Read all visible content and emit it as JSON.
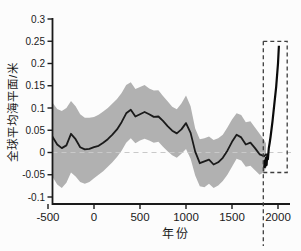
{
  "colors": {
    "background": "#fcfcfc",
    "band": "#b1b1b1",
    "median": "#1a1a1a",
    "instrumental": "#0a0a0a",
    "axis": "#1a1a1a",
    "text": "#1a1a1a",
    "zero_line": "#c9c9c9",
    "highlight_box": "#3d3d3d"
  },
  "chart_data": {
    "type": "line",
    "title": "",
    "xlabel": "年份",
    "ylabel": "全球平均海平面/米",
    "xlim": [
      -500,
      2130
    ],
    "ylim": [
      -0.118,
      0.3
    ],
    "x_ticks": [
      -500,
      0,
      500,
      1000,
      1500,
      2000
    ],
    "y_tick_labels": [
      "0.3",
      "0.25",
      "0.2",
      "0.15",
      "0.1",
      "0.05",
      "0",
      "-0.05",
      "-0.1"
    ],
    "grid": false,
    "legend": "none",
    "zero_reference_line": {
      "value": 0,
      "style": "dashed"
    },
    "highlight_box": {
      "x0": 1840,
      "x1": 2100,
      "y0": -0.045,
      "y1": 0.25,
      "style": "dashed",
      "note": "box around instrumental period; left edge extends below x-axis"
    },
    "series": [
      {
        "name": "reconstruction_uncertainty",
        "type": "band",
        "x": [
          -500,
          -450,
          -400,
          -350,
          -300,
          -250,
          -200,
          -150,
          -100,
          -50,
          0,
          50,
          100,
          150,
          200,
          250,
          300,
          350,
          400,
          450,
          500,
          550,
          600,
          650,
          700,
          750,
          800,
          850,
          900,
          950,
          1000,
          1050,
          1100,
          1150,
          1200,
          1250,
          1300,
          1350,
          1400,
          1450,
          1500,
          1550,
          1600,
          1650,
          1700,
          1750,
          1800,
          1850,
          1870
        ],
        "upper": [
          0.13,
          0.112,
          0.098,
          0.093,
          0.1,
          0.116,
          0.104,
          0.086,
          0.078,
          0.078,
          0.08,
          0.085,
          0.092,
          0.1,
          0.11,
          0.12,
          0.134,
          0.152,
          0.158,
          0.143,
          0.147,
          0.152,
          0.144,
          0.139,
          0.14,
          0.127,
          0.115,
          0.103,
          0.097,
          0.11,
          0.128,
          0.104,
          0.054,
          0.03,
          0.032,
          0.036,
          0.028,
          0.032,
          0.04,
          0.056,
          0.074,
          0.088,
          0.084,
          0.068,
          0.07,
          0.056,
          0.042,
          0.028,
          0.02
        ],
        "lower": [
          -0.035,
          -0.055,
          -0.072,
          -0.08,
          -0.068,
          -0.045,
          -0.054,
          -0.066,
          -0.07,
          -0.066,
          -0.058,
          -0.05,
          -0.042,
          -0.032,
          -0.022,
          -0.01,
          0.004,
          0.022,
          0.032,
          0.021,
          0.027,
          0.031,
          0.027,
          0.022,
          0.024,
          0.013,
          0.003,
          -0.006,
          -0.012,
          -0.003,
          0.008,
          -0.014,
          -0.052,
          -0.076,
          -0.078,
          -0.07,
          -0.08,
          -0.074,
          -0.064,
          -0.05,
          -0.032,
          -0.014,
          -0.018,
          -0.032,
          -0.03,
          -0.04,
          -0.05,
          -0.044,
          -0.034
        ]
      },
      {
        "name": "reconstruction_median",
        "type": "line",
        "x": [
          -500,
          -450,
          -400,
          -350,
          -300,
          -250,
          -200,
          -150,
          -100,
          -50,
          0,
          50,
          100,
          150,
          200,
          250,
          300,
          350,
          400,
          450,
          500,
          550,
          600,
          650,
          700,
          750,
          800,
          850,
          900,
          950,
          1000,
          1050,
          1100,
          1150,
          1200,
          1250,
          1300,
          1350,
          1400,
          1450,
          1500,
          1550,
          1600,
          1650,
          1700,
          1750,
          1800,
          1850,
          1870
        ],
        "y": [
          0.047,
          0.035,
          0.018,
          0.01,
          0.016,
          0.042,
          0.03,
          0.012,
          0.007,
          0.008,
          0.012,
          0.015,
          0.022,
          0.03,
          0.04,
          0.052,
          0.068,
          0.088,
          0.096,
          0.081,
          0.086,
          0.091,
          0.086,
          0.08,
          0.081,
          0.071,
          0.059,
          0.049,
          0.043,
          0.052,
          0.066,
          0.044,
          0.002,
          -0.024,
          -0.02,
          -0.016,
          -0.027,
          -0.022,
          -0.012,
          0.004,
          0.024,
          0.04,
          0.034,
          0.018,
          0.022,
          0.01,
          -0.004,
          -0.008,
          -0.004
        ]
      },
      {
        "name": "instrumental_record",
        "type": "line",
        "x": [
          1850,
          1856,
          1862,
          1870,
          1876,
          1884,
          1890,
          1900,
          1910,
          1920,
          1940,
          1960,
          1980,
          2000,
          2010
        ],
        "y": [
          -0.035,
          -0.018,
          -0.032,
          -0.012,
          -0.028,
          -0.005,
          -0.015,
          0.01,
          0.022,
          0.036,
          0.07,
          0.108,
          0.148,
          0.2,
          0.24
        ]
      }
    ]
  }
}
